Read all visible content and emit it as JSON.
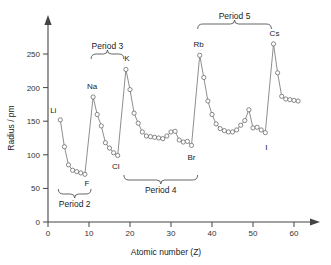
{
  "chart_data": {
    "type": "line",
    "title": "",
    "xlabel": "Atomic number (Z)",
    "ylabel": "Radius / pm",
    "xlim": [
      0,
      63
    ],
    "ylim": [
      0,
      270
    ],
    "xticks": [
      0,
      10,
      20,
      30,
      40,
      50,
      60
    ],
    "yticks": [
      0,
      50,
      100,
      150,
      200,
      250
    ],
    "grid": false,
    "legend": "none",
    "series": [
      {
        "name": "Atomic radius",
        "x": [
          3,
          4,
          5,
          6,
          7,
          8,
          9,
          11,
          12,
          13,
          14,
          15,
          16,
          17,
          19,
          20,
          21,
          22,
          23,
          24,
          25,
          26,
          27,
          28,
          29,
          30,
          31,
          32,
          33,
          34,
          35,
          37,
          38,
          39,
          40,
          41,
          42,
          43,
          44,
          45,
          46,
          47,
          48,
          49,
          50,
          51,
          52,
          53,
          55,
          56,
          57,
          58,
          59,
          60,
          61
        ],
        "values": [
          152,
          112,
          85,
          77,
          75,
          73,
          71,
          186,
          160,
          143,
          118,
          110,
          103,
          99,
          227,
          197,
          162,
          147,
          134,
          128,
          127,
          126,
          125,
          124,
          128,
          134,
          135,
          122,
          119,
          120,
          114,
          248,
          215,
          180,
          160,
          146,
          139,
          136,
          134,
          134,
          137,
          144,
          151,
          167,
          140,
          141,
          137,
          133,
          265,
          222,
          187,
          183,
          182,
          181,
          180
        ]
      }
    ],
    "point_labels": [
      {
        "element": "Li",
        "z": 3,
        "radius": 152
      },
      {
        "element": "F",
        "z": 9,
        "radius": 71
      },
      {
        "element": "Na",
        "z": 11,
        "radius": 186
      },
      {
        "element": "Cl",
        "z": 17,
        "radius": 99
      },
      {
        "element": "K",
        "z": 19,
        "radius": 227
      },
      {
        "element": "Br",
        "z": 35,
        "radius": 114
      },
      {
        "element": "Rb",
        "z": 37,
        "radius": 248
      },
      {
        "element": "I",
        "z": 53,
        "radius": 133
      },
      {
        "element": "Cs",
        "z": 55,
        "radius": 265
      }
    ],
    "annotations": [
      {
        "label": "Period 2",
        "z_start": 3,
        "z_end": 10,
        "position": "below"
      },
      {
        "label": "Period 3",
        "z_start": 11,
        "z_end": 18,
        "position": "above"
      },
      {
        "label": "Period 4",
        "z_start": 19,
        "z_end": 36,
        "position": "below"
      },
      {
        "label": "Period 5",
        "z_start": 37,
        "z_end": 54,
        "position": "above"
      }
    ]
  },
  "axes": {
    "y_title": "Radius / pm",
    "x_title": "Atomic number (Z)",
    "y_tick_labels": [
      "0",
      "50",
      "100",
      "150",
      "200",
      "250"
    ],
    "x_tick_labels": [
      "0",
      "10",
      "20",
      "30",
      "40",
      "50",
      "60"
    ]
  },
  "element_labels": {
    "li": "Li",
    "f": "F",
    "na": "Na",
    "cl": "Cl",
    "k": "K",
    "br": "Br",
    "rb": "Rb",
    "i": "I",
    "cs": "Cs"
  },
  "period_labels": {
    "p2": "Period 2",
    "p3": "Period 3",
    "p4": "Period 4",
    "p5": "Period 5"
  },
  "colors": {
    "line": "#7a7a7a",
    "marker_fill": "#ffffff",
    "marker_stroke": "#6b6b6b",
    "axis": "#444444",
    "text": "#222222"
  }
}
